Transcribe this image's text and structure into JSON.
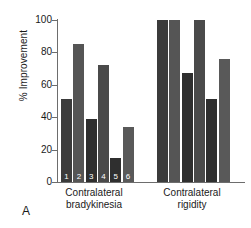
{
  "panel": {
    "letter": "A"
  },
  "chart_data": {
    "type": "bar",
    "title": "",
    "xlabel": "",
    "ylabel": "% Improvement",
    "ylim": [
      0,
      100
    ],
    "yticks": [
      0,
      20,
      40,
      60,
      80,
      100
    ],
    "ytick_labels": [
      "0",
      "20",
      "40",
      "60",
      "80",
      "100"
    ],
    "grid": false,
    "legend": "none",
    "categories": [
      "Contralateral bradykinesia",
      "Contralateral rigidity"
    ],
    "category_labels": [
      {
        "line1": "Contralateral",
        "line2": "bradykinesia"
      },
      {
        "line1": "Contralateral",
        "line2": "rigidity"
      }
    ],
    "bar_numbers": [
      "1",
      "2",
      "3",
      "4",
      "5",
      "6"
    ],
    "series": [
      {
        "name": "1",
        "values": [
          51,
          100
        ],
        "color": "#3b3b3b"
      },
      {
        "name": "2",
        "values": [
          85,
          100
        ],
        "color": "#555555"
      },
      {
        "name": "3",
        "values": [
          39,
          67
        ],
        "color": "#2f2f2f"
      },
      {
        "name": "4",
        "values": [
          72,
          100
        ],
        "color": "#4a4a4a"
      },
      {
        "name": "5",
        "values": [
          15,
          51
        ],
        "color": "#2f2f2f"
      },
      {
        "name": "6",
        "values": [
          34,
          76
        ],
        "color": "#595959"
      }
    ],
    "groups": [
      {
        "name": "Contralateral bradykinesia",
        "bars": [
          {
            "label": "1",
            "value": 51,
            "color": "#3b3b3b"
          },
          {
            "label": "2",
            "value": 85,
            "color": "#555555"
          },
          {
            "label": "3",
            "value": 39,
            "color": "#2f2f2f"
          },
          {
            "label": "4",
            "value": 72,
            "color": "#4a4a4a"
          },
          {
            "label": "5",
            "value": 15,
            "color": "#2f2f2f"
          },
          {
            "label": "6",
            "value": 34,
            "color": "#595959"
          }
        ]
      },
      {
        "name": "Contralateral rigidity",
        "bars": [
          {
            "label": "",
            "value": 100,
            "color": "#3b3b3b"
          },
          {
            "label": "",
            "value": 100,
            "color": "#555555"
          },
          {
            "label": "",
            "value": 67,
            "color": "#2f2f2f"
          },
          {
            "label": "",
            "value": 100,
            "color": "#4a4a4a"
          },
          {
            "label": "",
            "value": 51,
            "color": "#2f2f2f"
          },
          {
            "label": "",
            "value": 76,
            "color": "#595959"
          }
        ]
      }
    ]
  }
}
